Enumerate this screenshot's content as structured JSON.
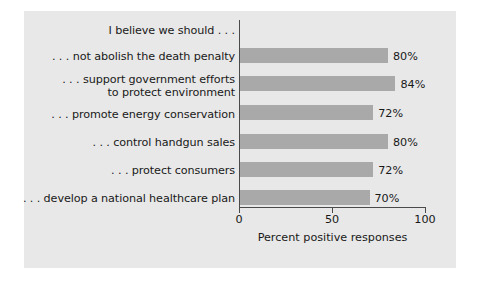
{
  "chart_data": {
    "type": "bar",
    "orientation": "horizontal",
    "title": "I believe we should . . .",
    "xlabel": "Percent positive responses",
    "ylabel": "",
    "xlim": [
      0,
      100
    ],
    "xticks": [
      0,
      50,
      100
    ],
    "xtick_labels": [
      "0",
      "50",
      "100"
    ],
    "grid": false,
    "legend": false,
    "bar_color": "#a9a9a9",
    "panel_color": "#e8e8e8",
    "axis_color": "#4a4a4a",
    "text_color": "#191919",
    "categories": [
      ". . . not abolish the death penalty",
      ". . . support government efforts\nto protect environment",
      ". . . promote energy conservation",
      ". . . control handgun sales",
      ". . . protect consumers",
      ". . . develop a national healthcare plan"
    ],
    "values": [
      80,
      84,
      72,
      80,
      72,
      70
    ],
    "value_labels": [
      "80%",
      "84%",
      "72%",
      "80%",
      "72%",
      "70%"
    ]
  }
}
